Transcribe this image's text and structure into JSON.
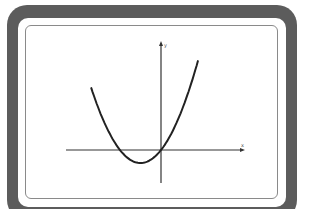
{
  "chart_data": {
    "type": "line",
    "title": "",
    "xlabel": "x",
    "ylabel": "y",
    "grid": false,
    "series": [
      {
        "name": "parabola",
        "equation": "y = x^2 + 2x (approx., vertex left of origin, passes through origin)",
        "x": [
          -3.4,
          -3,
          -2,
          -1,
          0,
          1,
          1.8
        ],
        "y": [
          4.76,
          3,
          0,
          -1,
          0,
          3,
          6.84
        ]
      }
    ],
    "vertex": {
      "x": -1,
      "y": -1
    },
    "axes": {
      "x_arrow": true,
      "y_arrow": true,
      "origin_on_curve": true
    }
  },
  "labels": {
    "x_axis": "x",
    "y_axis": "y"
  },
  "colors": {
    "frame": "#5c5c5c",
    "screen_border": "#8a8a8a",
    "curve": "#222222",
    "axes": "#333333"
  }
}
